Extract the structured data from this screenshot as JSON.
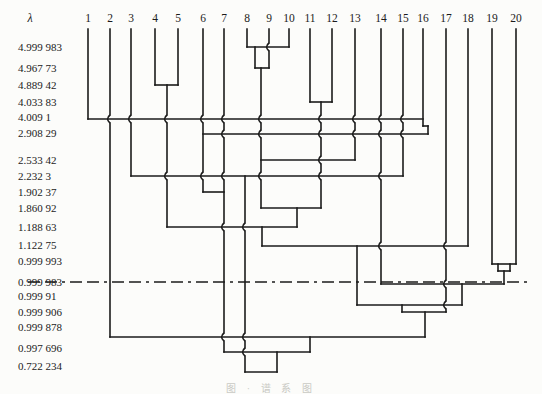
{
  "figure": {
    "axis_symbol": "λ",
    "caption": "图 · 谱 系 图",
    "width": 542,
    "height": 394
  },
  "colors": {
    "ink": "#1b1b1b",
    "background": "#fcfcfa",
    "caption_gray": "#b9b9b2"
  },
  "leaves": [
    {
      "label": "1",
      "x": 88
    },
    {
      "label": "2",
      "x": 110
    },
    {
      "label": "3",
      "x": 131
    },
    {
      "label": "4",
      "x": 155
    },
    {
      "label": "5",
      "x": 178
    },
    {
      "label": "6",
      "x": 203
    },
    {
      "label": "7",
      "x": 224
    },
    {
      "label": "8",
      "x": 247
    },
    {
      "label": "9",
      "x": 269
    },
    {
      "label": "10",
      "x": 289
    },
    {
      "label": "11",
      "x": 310
    },
    {
      "label": "12",
      "x": 332
    },
    {
      "label": "13",
      "x": 355
    },
    {
      "label": "14",
      "x": 381
    },
    {
      "label": "15",
      "x": 403
    },
    {
      "label": "16",
      "x": 423
    },
    {
      "label": "17",
      "x": 446
    },
    {
      "label": "18",
      "x": 468
    },
    {
      "label": "19",
      "x": 492
    },
    {
      "label": "20",
      "x": 516
    }
  ],
  "lambdas": [
    {
      "label": "4.999 983",
      "y": 47
    },
    {
      "label": "4.967 73",
      "y": 68
    },
    {
      "label": "4.889 42",
      "y": 85
    },
    {
      "label": "4.033 83",
      "y": 102
    },
    {
      "label": "4.009 1",
      "y": 117
    },
    {
      "label": "2.908 29",
      "y": 133
    },
    {
      "label": "2.533 42",
      "y": 160
    },
    {
      "label": "2.232 3",
      "y": 176
    },
    {
      "label": "1.902 37",
      "y": 192
    },
    {
      "label": "1.860 92",
      "y": 208
    },
    {
      "label": "1.188 63",
      "y": 227
    },
    {
      "label": "1.122 75",
      "y": 245
    },
    {
      "label": "0.999 993",
      "y": 261
    },
    {
      "label": "0.999 983",
      "y": 282
    },
    {
      "label": "0.999 91",
      "y": 296
    },
    {
      "label": "0.999 906",
      "y": 312
    },
    {
      "label": "0.999 878",
      "y": 327
    },
    {
      "label": "0.997 696",
      "y": 348
    },
    {
      "label": "0.722 234",
      "y": 366
    }
  ],
  "dendrogram": {
    "leaf_top_y": 29,
    "label_row_y": 22,
    "lambda_label_x": 18,
    "axis_symbol_x": 30,
    "cut_line": {
      "lambda": "0.999 983",
      "y": 282,
      "x1": 28,
      "x2": 532,
      "dash": "12 5 12 5 3 5"
    },
    "verticals": [
      {
        "x": 88,
        "y1": 29,
        "y2": 119
      },
      {
        "x": 110,
        "y1": 29,
        "y2": 337
      },
      {
        "x": 131,
        "y1": 29,
        "y2": 176
      },
      {
        "x": 155,
        "y1": 29,
        "y2": 85
      },
      {
        "x": 178,
        "y1": 29,
        "y2": 85
      },
      {
        "x": 167,
        "y1": 85,
        "y2": 227
      },
      {
        "x": 203,
        "y1": 29,
        "y2": 192
      },
      {
        "x": 224,
        "y1": 29,
        "y2": 352
      },
      {
        "x": 247,
        "y1": 29,
        "y2": 47
      },
      {
        "x": 269,
        "y1": 29,
        "y2": 68
      },
      {
        "x": 289,
        "y1": 29,
        "y2": 47
      },
      {
        "x": 255,
        "y1": 47,
        "y2": 68
      },
      {
        "x": 261,
        "y1": 68,
        "y2": 208
      },
      {
        "x": 310,
        "y1": 29,
        "y2": 102
      },
      {
        "x": 332,
        "y1": 29,
        "y2": 102
      },
      {
        "x": 321,
        "y1": 102,
        "y2": 208
      },
      {
        "x": 297,
        "y1": 208,
        "y2": 227
      },
      {
        "x": 355,
        "y1": 29,
        "y2": 160
      },
      {
        "x": 381,
        "y1": 29,
        "y2": 284
      },
      {
        "x": 403,
        "y1": 29,
        "y2": 176
      },
      {
        "x": 423,
        "y1": 29,
        "y2": 126
      },
      {
        "x": 428,
        "y1": 126,
        "y2": 134
      },
      {
        "x": 446,
        "y1": 29,
        "y2": 312
      },
      {
        "x": 468,
        "y1": 29,
        "y2": 246
      },
      {
        "x": 492,
        "y1": 29,
        "y2": 264
      },
      {
        "x": 516,
        "y1": 29,
        "y2": 264
      },
      {
        "x": 498,
        "y1": 264,
        "y2": 271
      },
      {
        "x": 510,
        "y1": 264,
        "y2": 271
      },
      {
        "x": 504,
        "y1": 271,
        "y2": 284
      },
      {
        "x": 245,
        "y1": 176,
        "y2": 372
      },
      {
        "x": 262,
        "y1": 227,
        "y2": 246
      },
      {
        "x": 357,
        "y1": 246,
        "y2": 305
      },
      {
        "x": 462,
        "y1": 284,
        "y2": 305
      },
      {
        "x": 402,
        "y1": 305,
        "y2": 312
      },
      {
        "x": 425,
        "y1": 312,
        "y2": 337
      },
      {
        "x": 310,
        "y1": 337,
        "y2": 352
      },
      {
        "x": 277,
        "y1": 352,
        "y2": 372
      }
    ],
    "horizontals": [
      {
        "x1": 247,
        "x2": 289,
        "y": 47
      },
      {
        "x1": 255,
        "x2": 269,
        "y": 68
      },
      {
        "x1": 155,
        "x2": 178,
        "y": 85
      },
      {
        "x1": 310,
        "x2": 332,
        "y": 102
      },
      {
        "x1": 88,
        "x2": 423,
        "y": 119
      },
      {
        "x1": 423,
        "x2": 428,
        "y": 126
      },
      {
        "x1": 203,
        "x2": 428,
        "y": 134
      },
      {
        "x1": 261,
        "x2": 355,
        "y": 160
      },
      {
        "x1": 131,
        "x2": 403,
        "y": 176
      },
      {
        "x1": 203,
        "x2": 224,
        "y": 192
      },
      {
        "x1": 261,
        "x2": 321,
        "y": 208
      },
      {
        "x1": 167,
        "x2": 297,
        "y": 227
      },
      {
        "x1": 262,
        "x2": 468,
        "y": 246
      },
      {
        "x1": 492,
        "x2": 516,
        "y": 264
      },
      {
        "x1": 498,
        "x2": 510,
        "y": 271
      },
      {
        "x1": 381,
        "x2": 504,
        "y": 284
      },
      {
        "x1": 357,
        "x2": 462,
        "y": 305
      },
      {
        "x1": 402,
        "x2": 446,
        "y": 312
      },
      {
        "x1": 110,
        "x2": 425,
        "y": 337
      },
      {
        "x1": 224,
        "x2": 310,
        "y": 352
      },
      {
        "x1": 245,
        "x2": 277,
        "y": 372
      }
    ],
    "jogs": [
      {
        "x": 269,
        "y": 47
      },
      {
        "x": 110,
        "y": 119
      },
      {
        "x": 131,
        "y": 119
      },
      {
        "x": 167,
        "y": 119
      },
      {
        "x": 203,
        "y": 119
      },
      {
        "x": 224,
        "y": 119
      },
      {
        "x": 261,
        "y": 119
      },
      {
        "x": 321,
        "y": 119
      },
      {
        "x": 355,
        "y": 119
      },
      {
        "x": 381,
        "y": 119
      },
      {
        "x": 403,
        "y": 119
      },
      {
        "x": 224,
        "y": 134
      },
      {
        "x": 261,
        "y": 134
      },
      {
        "x": 321,
        "y": 134
      },
      {
        "x": 355,
        "y": 134
      },
      {
        "x": 381,
        "y": 134
      },
      {
        "x": 403,
        "y": 134
      },
      {
        "x": 321,
        "y": 160
      },
      {
        "x": 167,
        "y": 176
      },
      {
        "x": 203,
        "y": 176
      },
      {
        "x": 224,
        "y": 176
      },
      {
        "x": 261,
        "y": 176
      },
      {
        "x": 321,
        "y": 176
      },
      {
        "x": 381,
        "y": 176
      },
      {
        "x": 224,
        "y": 227
      },
      {
        "x": 245,
        "y": 227
      },
      {
        "x": 381,
        "y": 246
      },
      {
        "x": 446,
        "y": 246
      },
      {
        "x": 446,
        "y": 284
      },
      {
        "x": 446,
        "y": 305
      },
      {
        "x": 224,
        "y": 337
      },
      {
        "x": 245,
        "y": 337
      },
      {
        "x": 245,
        "y": 352
      }
    ]
  }
}
